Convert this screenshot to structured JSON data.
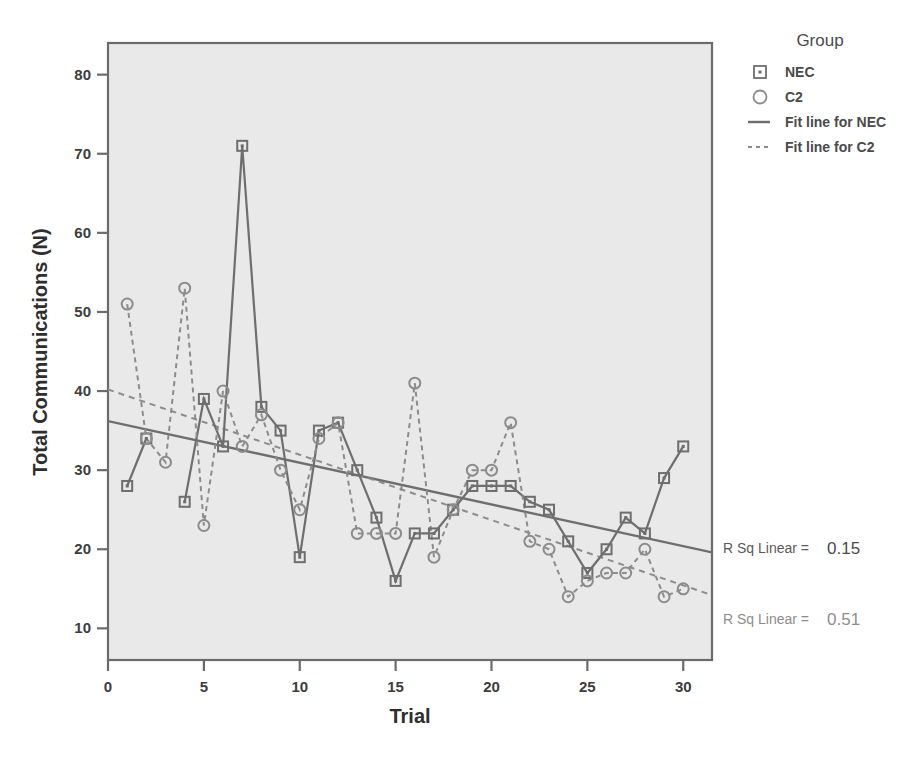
{
  "chart_data": {
    "type": "scatter",
    "title": "",
    "xlabel": "Trial",
    "ylabel": "Total Communications (N)",
    "xlim": [
      0,
      31.5
    ],
    "ylim": [
      6,
      84
    ],
    "xticks": [
      0,
      5,
      10,
      15,
      20,
      25,
      30
    ],
    "yticks": [
      10,
      20,
      30,
      40,
      50,
      60,
      70,
      80
    ],
    "grid": false,
    "legend_position": "right",
    "legend_title": "Group",
    "x": [
      1,
      2,
      3,
      4,
      5,
      6,
      7,
      8,
      9,
      10,
      11,
      12,
      13,
      14,
      15,
      16,
      17,
      18,
      19,
      20,
      21,
      22,
      23,
      24,
      25,
      26,
      27,
      28,
      29,
      30
    ],
    "series": [
      {
        "name": "NEC",
        "marker": "square",
        "line": "solid",
        "color": "#6e6e6e",
        "values": [
          28,
          34,
          null,
          26,
          39,
          33,
          71,
          38,
          35,
          19,
          35,
          36,
          30,
          24,
          16,
          22,
          22,
          25,
          28,
          28,
          28,
          26,
          25,
          21,
          17,
          20,
          24,
          22,
          29,
          33
        ]
      },
      {
        "name": "C2",
        "marker": "circle",
        "line": "dashed",
        "color": "#8c8c8c",
        "values": [
          51,
          34,
          31,
          53,
          23,
          40,
          33,
          37,
          30,
          25,
          34,
          36,
          22,
          22,
          22,
          41,
          19,
          25,
          30,
          30,
          36,
          21,
          20,
          14,
          16,
          17,
          17,
          20,
          14,
          15
        ]
      }
    ],
    "fit_lines": [
      {
        "name": "Fit line for NEC",
        "style": "solid",
        "color": "#6e6e6e",
        "x0": 0,
        "y0": 36.2,
        "x1": 31.5,
        "y1": 19.6,
        "r_sq_label": "R Sq Linear =",
        "r_sq_value": "0.15"
      },
      {
        "name": "Fit line for C2",
        "style": "dashed",
        "color": "#8c8c8c",
        "x0": 0,
        "y0": 40.2,
        "x1": 31.5,
        "y1": 14.2,
        "r_sq_label": "R Sq Linear =",
        "r_sq_value": "0.51"
      }
    ]
  },
  "legend": {
    "title": "Group",
    "items": [
      {
        "label": "NEC",
        "glyph": "square-marker"
      },
      {
        "label": "C2",
        "glyph": "circle-marker"
      },
      {
        "label": "Fit line for NEC",
        "glyph": "solid-line"
      },
      {
        "label": "Fit line for C2",
        "glyph": "dashed-line"
      }
    ]
  },
  "annotations": [
    {
      "label": "R Sq Linear =",
      "value": "0.15"
    },
    {
      "label": "R Sq Linear =",
      "value": "0.51"
    }
  ],
  "axes": {
    "x_label": "Trial",
    "y_label": "Total Communications (N)",
    "x_ticks": [
      "0",
      "5",
      "10",
      "15",
      "20",
      "25",
      "30"
    ],
    "y_ticks": [
      "10",
      "20",
      "30",
      "40",
      "50",
      "60",
      "70",
      "80"
    ]
  },
  "colors": {
    "plot_background": "#e9e9e9",
    "plot_border": "#6b6b6b",
    "nec": "#6e6e6e",
    "c2": "#8c8c8c",
    "page_background": "#ffffff"
  }
}
